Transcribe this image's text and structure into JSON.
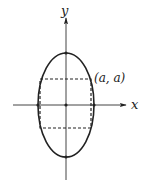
{
  "diagram": {
    "type": "ellipse-with-inscribed-rectangle",
    "axes": {
      "x_label": "x",
      "y_label": "y"
    },
    "point_label": "(a, a)",
    "colors": {
      "stroke": "#222222",
      "background": "#ffffff"
    }
  }
}
